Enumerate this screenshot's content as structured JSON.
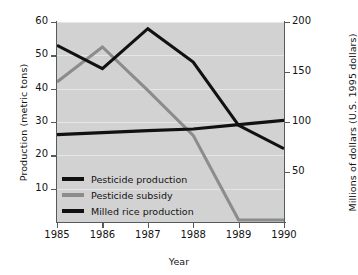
{
  "chart_data": {
    "type": "line",
    "title": "",
    "xlabel": "Year",
    "ylabel": "Production (metric tons)",
    "ylabel_right": "Millions of dollars (U.S. 1995 dollars)",
    "categories": [
      "1985",
      "1986",
      "1987",
      "1988",
      "1989",
      "1990"
    ],
    "x": [
      1985,
      1986,
      1987,
      1988,
      1989,
      1990
    ],
    "xlim": [
      1985,
      1990
    ],
    "ylim": [
      0,
      60
    ],
    "ylim_right": [
      0,
      200
    ],
    "grid": true,
    "legend_position": "lower-left",
    "yticks": [
      "10",
      "20",
      "30",
      "40",
      "50",
      "60"
    ],
    "ytick_values": [
      10,
      20,
      30,
      40,
      50,
      60
    ],
    "yticks_right": [
      "50",
      "100",
      "150",
      "200"
    ],
    "ytick_right_values": [
      50,
      100,
      150,
      200
    ],
    "series": [
      {
        "name": "Pesticide production",
        "axis": "left",
        "color": "#111111",
        "values": [
          53,
          46,
          58,
          48,
          29,
          22
        ]
      },
      {
        "name": "Pesticide subsidy",
        "axis": "left",
        "color": "#8c8c8c",
        "values": [
          42,
          52.5,
          39.5,
          26,
          0.6,
          0.6
        ]
      },
      {
        "name": "Milled rice production",
        "axis": "left",
        "color": "#111111",
        "values": [
          26.2,
          26.8,
          27.4,
          27.9,
          29.2,
          30.5
        ]
      }
    ]
  },
  "legend": {
    "items": [
      {
        "label": "Pesticide production",
        "color": "#111111"
      },
      {
        "label": "Pesticide subsidy",
        "color": "#8c8c8c"
      },
      {
        "label": "Milled rice production",
        "color": "#111111"
      }
    ]
  },
  "colors": {
    "plot_background": "#d2d2d2",
    "page_background": "#ffffff",
    "axis": "#555a5e",
    "gridline": "#eaeaea",
    "text": "#141414"
  }
}
